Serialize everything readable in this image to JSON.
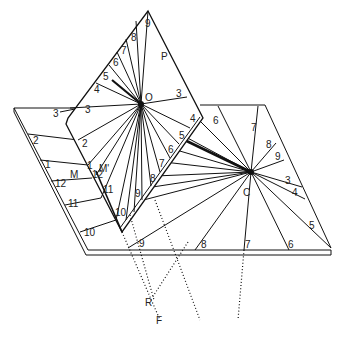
{
  "diagram": {
    "type": "geometric sundial construction",
    "points": {
      "O": {
        "label": "O",
        "x": 141,
        "y": 104
      },
      "C": {
        "label": "C",
        "x": 251,
        "y": 172
      },
      "P": {
        "label": "P",
        "x": 163,
        "y": 56
      },
      "M": {
        "label": "M",
        "x": 73,
        "y": 200
      },
      "M_prime": {
        "label": "M'",
        "x": 100,
        "y": 186
      },
      "R": {
        "label": "R",
        "x": 148,
        "y": 302
      },
      "F": {
        "label": "F",
        "x": 158,
        "y": 320
      }
    },
    "polar_dial_hours": [
      "3",
      "4",
      "5",
      "6",
      "7",
      "8",
      "9",
      "3",
      "2",
      "1",
      "12",
      "11",
      "10",
      "9",
      "8",
      "7",
      "6",
      "5",
      "4"
    ],
    "horizontal_dial_hours": [
      "3",
      "2",
      "1",
      "12",
      "11",
      "10",
      "9",
      "8",
      "7",
      "6",
      "5",
      "4",
      "3",
      "9",
      "8",
      "7",
      "6"
    ],
    "labels": [
      {
        "t": "9",
        "x": 145,
        "y": 27
      },
      {
        "t": "8",
        "x": 131,
        "y": 41
      },
      {
        "t": "7",
        "x": 122,
        "y": 54
      },
      {
        "t": "6",
        "x": 113,
        "y": 66
      },
      {
        "t": "5",
        "x": 104,
        "y": 80
      },
      {
        "t": "4",
        "x": 95,
        "y": 93
      },
      {
        "t": "P",
        "x": 161,
        "y": 58
      },
      {
        "t": "O",
        "x": 145,
        "y": 100
      },
      {
        "t": "3",
        "x": 176,
        "y": 96
      },
      {
        "t": "3",
        "x": 84,
        "y": 112
      },
      {
        "t": "3",
        "x": 53,
        "y": 114
      },
      {
        "t": "3'",
        "x": 23,
        "y": 115
      },
      {
        "t": "2",
        "x": 33,
        "y": 143
      },
      {
        "t": "2",
        "x": 83,
        "y": 146
      },
      {
        "t": "1",
        "x": 45,
        "y": 168
      },
      {
        "t": "1",
        "x": 88,
        "y": 171
      },
      {
        "t": "M'",
        "x": 99,
        "y": 172
      },
      {
        "t": "M",
        "x": 70,
        "y": 178
      },
      {
        "t": "12",
        "x": 92,
        "y": 178
      },
      {
        "t": "12",
        "x": 56,
        "y": 186
      },
      {
        "t": "11",
        "x": 103,
        "y": 192
      },
      {
        "t": "11",
        "x": 69,
        "y": 208
      },
      {
        "t": "10",
        "x": 114,
        "y": 215
      },
      {
        "t": "10",
        "x": 84,
        "y": 236
      },
      {
        "t": "9",
        "x": 135,
        "y": 196
      },
      {
        "t": "8",
        "x": 150,
        "y": 182
      },
      {
        "t": "7",
        "x": 159,
        "y": 167
      },
      {
        "t": "6",
        "x": 168,
        "y": 153
      },
      {
        "t": "5",
        "x": 178,
        "y": 139
      },
      {
        "t": "4",
        "x": 190,
        "y": 122
      },
      {
        "t": "6",
        "x": 213,
        "y": 122
      },
      {
        "t": "7",
        "x": 252,
        "y": 130
      },
      {
        "t": "8",
        "x": 267,
        "y": 148
      },
      {
        "t": "9",
        "x": 276,
        "y": 160
      },
      {
        "t": "C",
        "x": 244,
        "y": 195
      },
      {
        "t": "3",
        "x": 289,
        "y": 182
      },
      {
        "t": "4",
        "x": 294,
        "y": 194
      },
      {
        "t": "5",
        "x": 311,
        "y": 229
      },
      {
        "t": "6",
        "x": 290,
        "y": 248
      },
      {
        "t": "7",
        "x": 245,
        "y": 248
      },
      {
        "t": "8",
        "x": 201,
        "y": 248
      },
      {
        "t": "9",
        "x": 140,
        "y": 246
      },
      {
        "t": "R",
        "x": 145,
        "y": 306
      },
      {
        "t": "F",
        "x": 156,
        "y": 324
      }
    ]
  }
}
